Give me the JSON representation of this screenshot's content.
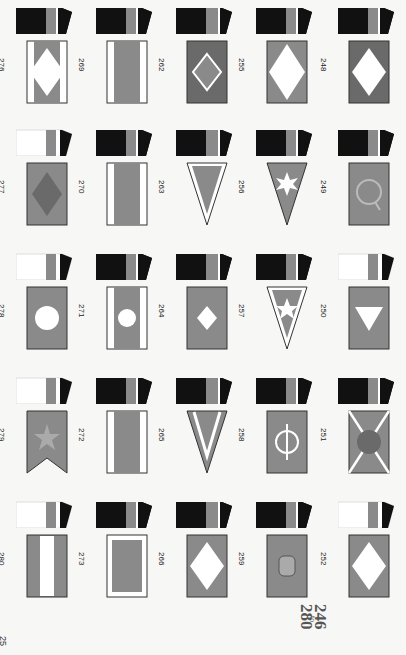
{
  "page": {
    "page_number": "25",
    "range_start": "246",
    "range_to": "to",
    "range_end": "280",
    "orientation": "rotated 90 degrees clockwise",
    "colors": {
      "funnel_black": "#111111",
      "flag_gray": "#8a8a8a",
      "dark_gray": "#6a6a6a",
      "white": "#ffffff"
    }
  },
  "columns": [
    {
      "items": [
        {
          "number": "276",
          "flag_text": "P",
          "flag_motif": "white band edges, gray center, white diamond with letter",
          "funnel": "black with gray band and P diamond"
        },
        {
          "number": "277",
          "flag_text": "H",
          "flag_motif": "gray field, dark diamond with H emblem",
          "funnel": "white with gray band, black top"
        },
        {
          "number": "278",
          "flag_text": "W",
          "flag_motif": "gray field, white circle with letter",
          "funnel": "white with gray band and W circle, black top"
        },
        {
          "number": "279",
          "flag_text": "",
          "flag_motif": "swallowtail gray with star",
          "funnel": "white with gray band star, black top"
        },
        {
          "number": "280",
          "flag_text": "MAMENIC",
          "flag_motif": "gray with white center stripe lettering",
          "funnel": "white with striped band, black top"
        }
      ]
    },
    {
      "items": [
        {
          "number": "269",
          "flag_text": "F-S",
          "flag_motif": "white edges, gray center band with letters",
          "funnel": "black with gray band F-S"
        },
        {
          "number": "270",
          "flag_text": "C J",
          "flag_motif": "white edges, gray center band with letters",
          "funnel": "black with gray band CJ"
        },
        {
          "number": "271",
          "flag_text": "H",
          "flag_motif": "white edges, gray center with white circle H",
          "funnel": "black with gray band H"
        },
        {
          "number": "272",
          "flag_text": "H P",
          "flag_motif": "white edges, gray center band with letters",
          "funnel": "black with gray band HP"
        },
        {
          "number": "273",
          "flag_text": "IMCOV",
          "flag_motif": "white border, gray field with letters",
          "funnel": "black with gray band IMCOV"
        }
      ]
    },
    {
      "items": [
        {
          "number": "262",
          "flag_text": "S",
          "flag_motif": "dark field, diamond outline with letter",
          "funnel": "black with gray band"
        },
        {
          "number": "263",
          "flag_text": "AB",
          "flag_motif": "pennant white border gray with letters",
          "funnel": "black with gray band"
        },
        {
          "number": "264",
          "flag_text": "C",
          "flag_motif": "gray field, white diamond with letter",
          "funnel": "black with gray band"
        },
        {
          "number": "265",
          "flag_text": "",
          "flag_motif": "pennant gray with white V",
          "funnel": "black with gray band"
        },
        {
          "number": "266",
          "flag_text": "ÅL",
          "flag_motif": "gray field, white diamond with letters",
          "funnel": "black with gray band ÅL"
        }
      ]
    },
    {
      "items": [
        {
          "number": "255",
          "flag_text": "U",
          "flag_motif": "gray field, large white diamond with letter",
          "funnel": "black with gray band U diamond"
        },
        {
          "number": "256",
          "flag_text": "",
          "flag_motif": "pennant gray with white 8-point star",
          "funnel": "black with gray band star"
        },
        {
          "number": "257",
          "flag_text": "",
          "flag_motif": "pennant white border gray with star",
          "funnel": "black with gray band star"
        },
        {
          "number": "258",
          "flag_text": "Φ",
          "flag_motif": "gray field with circle and bar emblem",
          "funnel": "black with gray band emblem"
        },
        {
          "number": "259",
          "flag_text": "",
          "flag_motif": "gray field with crest emblem",
          "funnel": "black with gray band crest"
        }
      ]
    },
    {
      "items": [
        {
          "number": "248",
          "flag_text": "D",
          "flag_motif": "dark field, white diamond with letter",
          "funnel": "black with emblem"
        },
        {
          "number": "249",
          "flag_text": "Q",
          "flag_motif": "gray field, circular Q emblem",
          "funnel": "black with gray band Q"
        },
        {
          "number": "250",
          "flag_text": "I",
          "flag_motif": "gray field, white triangle with letter",
          "funnel": "white with gray band"
        },
        {
          "number": "251",
          "flag_text": "P",
          "flag_motif": "gray saltire with dark circle letter",
          "funnel": "black with gray P band"
        },
        {
          "number": "252",
          "flag_text": "P&B",
          "flag_motif": "gray field, white diamond with letters",
          "funnel": "white with gray band emblem"
        }
      ]
    }
  ]
}
